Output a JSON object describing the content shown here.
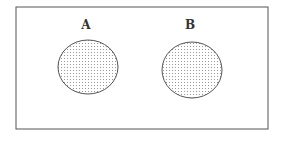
{
  "diagram": {
    "type": "venn",
    "universe": {
      "x": 16,
      "y": 7,
      "width": 252,
      "height": 122,
      "stroke": "#555555"
    },
    "sets": [
      {
        "label": "A",
        "label_x": 86,
        "label_y": 29,
        "cx": 88,
        "cy": 67,
        "rx": 30,
        "ry": 27,
        "fill": "dotted",
        "stroke": "#555555"
      },
      {
        "label": "B",
        "label_x": 190,
        "label_y": 29,
        "cx": 192,
        "cy": 70,
        "rx": 30,
        "ry": 28,
        "fill": "dotted",
        "stroke": "#555555"
      }
    ],
    "relation": "disjoint"
  }
}
